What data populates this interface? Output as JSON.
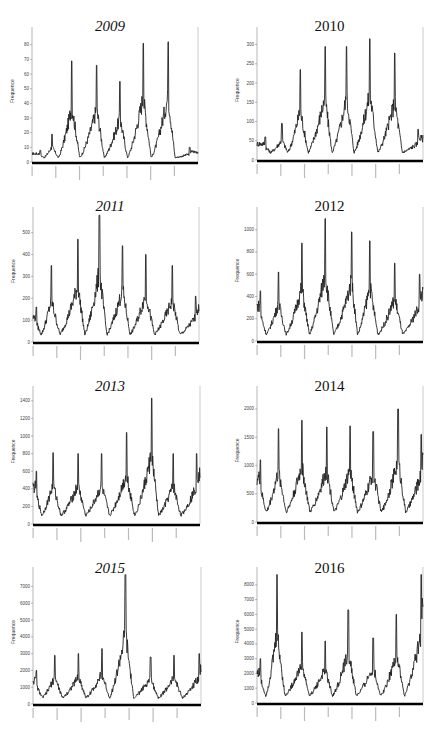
{
  "chart_data": [
    {
      "type": "line",
      "title": "2009",
      "title_italic": true,
      "xlabel": "",
      "ylabel": "Frequence",
      "ylim": [
        0,
        88
      ],
      "yticks": [
        0,
        10,
        20,
        30,
        40,
        50,
        60,
        70,
        80
      ],
      "x_ticks_count": 7,
      "baseline": 5,
      "trough": 3,
      "peaks": [
        {
          "x": 0.05,
          "v": 8
        },
        {
          "x": 0.12,
          "v": 19
        },
        {
          "x": 0.24,
          "v": 69
        },
        {
          "x": 0.39,
          "v": 66
        },
        {
          "x": 0.53,
          "v": 55
        },
        {
          "x": 0.67,
          "v": 81
        },
        {
          "x": 0.82,
          "v": 82
        },
        {
          "x": 0.95,
          "v": 10
        }
      ],
      "series": [
        {
          "name": "Frequence",
          "description": "daily frequency, seasonal peaks"
        }
      ]
    },
    {
      "type": "line",
      "title": "2010",
      "title_italic": false,
      "xlabel": "",
      "ylabel": "Frequence",
      "ylim": [
        0,
        330
      ],
      "yticks": [
        0,
        50,
        100,
        150,
        200,
        250,
        300
      ],
      "x_ticks_count": 7,
      "baseline": 40,
      "trough": 20,
      "peaks": [
        {
          "x": 0.05,
          "v": 60
        },
        {
          "x": 0.15,
          "v": 95
        },
        {
          "x": 0.26,
          "v": 235
        },
        {
          "x": 0.41,
          "v": 295
        },
        {
          "x": 0.54,
          "v": 295
        },
        {
          "x": 0.68,
          "v": 315
        },
        {
          "x": 0.83,
          "v": 278
        },
        {
          "x": 0.97,
          "v": 80
        }
      ],
      "series": [
        {
          "name": "Frequence",
          "description": "daily frequency, seasonal peaks"
        }
      ]
    },
    {
      "type": "line",
      "title": "2011",
      "title_italic": true,
      "xlabel": "",
      "ylabel": "Frequence",
      "ylim": [
        0,
        590
      ],
      "yticks": [
        0,
        100,
        200,
        300,
        400,
        500
      ],
      "x_ticks_count": 7,
      "baseline": 150,
      "trough": 35,
      "peaks": [
        {
          "x": 0.02,
          "v": 160
        },
        {
          "x": 0.11,
          "v": 350
        },
        {
          "x": 0.27,
          "v": 470
        },
        {
          "x": 0.4,
          "v": 580
        },
        {
          "x": 0.54,
          "v": 440
        },
        {
          "x": 0.68,
          "v": 400
        },
        {
          "x": 0.84,
          "v": 350
        },
        {
          "x": 0.98,
          "v": 210
        }
      ],
      "series": [
        {
          "name": "Frequence",
          "description": "daily frequency, seasonal peaks"
        }
      ]
    },
    {
      "type": "line",
      "title": "2012",
      "title_italic": false,
      "xlabel": "",
      "ylabel": "Frequence",
      "ylim": [
        0,
        1150
      ],
      "yticks": [
        0,
        200,
        400,
        600,
        800,
        1000
      ],
      "x_ticks_count": 7,
      "baseline": 400,
      "trough": 60,
      "peaks": [
        {
          "x": 0.02,
          "v": 450
        },
        {
          "x": 0.13,
          "v": 620
        },
        {
          "x": 0.27,
          "v": 880
        },
        {
          "x": 0.41,
          "v": 1100
        },
        {
          "x": 0.57,
          "v": 980
        },
        {
          "x": 0.68,
          "v": 900
        },
        {
          "x": 0.83,
          "v": 700
        },
        {
          "x": 0.98,
          "v": 600
        }
      ],
      "series": [
        {
          "name": "Frequence",
          "description": "daily frequency, seasonal peaks"
        }
      ]
    },
    {
      "type": "line",
      "title": "2013",
      "title_italic": true,
      "xlabel": "",
      "ylabel": "Frequence",
      "ylim": [
        0,
        1500
      ],
      "yticks": [
        0,
        200,
        400,
        600,
        800,
        1000,
        1200,
        1400
      ],
      "x_ticks_count": 7,
      "baseline": 450,
      "trough": 100,
      "peaks": [
        {
          "x": 0.02,
          "v": 600
        },
        {
          "x": 0.12,
          "v": 810
        },
        {
          "x": 0.27,
          "v": 800
        },
        {
          "x": 0.41,
          "v": 800
        },
        {
          "x": 0.56,
          "v": 1040
        },
        {
          "x": 0.71,
          "v": 1430
        },
        {
          "x": 0.84,
          "v": 800
        },
        {
          "x": 0.98,
          "v": 800
        }
      ],
      "series": [
        {
          "name": "Frequence",
          "description": "daily frequency, seasonal peaks"
        }
      ]
    },
    {
      "type": "line",
      "title": "2014",
      "title_italic": false,
      "xlabel": "",
      "ylabel": "Frequence",
      "ylim": [
        0,
        2300
      ],
      "yticks": [
        0,
        500,
        1000,
        1500,
        2000
      ],
      "x_ticks_count": 7,
      "baseline": 900,
      "trough": 180,
      "peaks": [
        {
          "x": 0.02,
          "v": 1100
        },
        {
          "x": 0.13,
          "v": 1650
        },
        {
          "x": 0.27,
          "v": 1800
        },
        {
          "x": 0.42,
          "v": 1680
        },
        {
          "x": 0.56,
          "v": 1700
        },
        {
          "x": 0.7,
          "v": 1600
        },
        {
          "x": 0.85,
          "v": 2000
        },
        {
          "x": 0.99,
          "v": 1550
        }
      ],
      "series": [
        {
          "name": "Frequence",
          "description": "daily frequency, seasonal peaks"
        }
      ]
    },
    {
      "type": "line",
      "title": "2015",
      "title_italic": true,
      "xlabel": "",
      "ylabel": "Frequence",
      "ylim": [
        0,
        7800
      ],
      "yticks": [
        0,
        1000,
        2000,
        3000,
        4000,
        5000,
        6000,
        7000
      ],
      "x_ticks_count": 7,
      "baseline": 1800,
      "trough": 380,
      "peaks": [
        {
          "x": 0.02,
          "v": 2000
        },
        {
          "x": 0.13,
          "v": 2900
        },
        {
          "x": 0.27,
          "v": 3000
        },
        {
          "x": 0.41,
          "v": 3300
        },
        {
          "x": 0.55,
          "v": 7700
        },
        {
          "x": 0.7,
          "v": 2800
        },
        {
          "x": 0.84,
          "v": 2900
        },
        {
          "x": 0.99,
          "v": 3000
        }
      ],
      "series": [
        {
          "name": "Frequence",
          "description": "daily frequency, seasonal peaks"
        }
      ]
    },
    {
      "type": "line",
      "title": "2016",
      "title_italic": false,
      "xlabel": "",
      "ylabel": "Frequence",
      "ylim": [
        0,
        8800
      ],
      "yticks": [
        0,
        1000,
        2000,
        3000,
        4000,
        5000,
        6000,
        7000,
        8000
      ],
      "x_ticks_count": 7,
      "baseline": 2500,
      "trough": 500,
      "peaks": [
        {
          "x": 0.02,
          "v": 3000
        },
        {
          "x": 0.12,
          "v": 8700
        },
        {
          "x": 0.27,
          "v": 4800
        },
        {
          "x": 0.41,
          "v": 4200
        },
        {
          "x": 0.55,
          "v": 6300
        },
        {
          "x": 0.7,
          "v": 4400
        },
        {
          "x": 0.84,
          "v": 6000
        },
        {
          "x": 0.99,
          "v": 8700
        }
      ],
      "series": [
        {
          "name": "Frequence",
          "description": "daily frequency, seasonal peaks"
        }
      ]
    }
  ]
}
